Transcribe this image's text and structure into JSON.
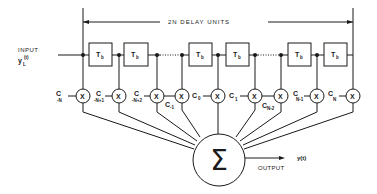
{
  "diagram": {
    "bracket_label": "2N   DELAY   UNITS",
    "input": {
      "label": "INPUT",
      "signal": "y",
      "signal_sub": "L",
      "signal_arg": "(t)"
    },
    "output": {
      "label": "OUTPUT",
      "signal": "y(t)"
    },
    "delay_label": "T",
    "delay_sub": "b",
    "multiplier_symbol": "X",
    "summer_symbol": "Σ",
    "coefficients": [
      {
        "c": "C",
        "sub": "-N"
      },
      {
        "c": "C",
        "sub": "-N+1"
      },
      {
        "c": "C",
        "sub": "-N+2"
      },
      {
        "c": "C",
        "sub": "-1"
      },
      {
        "c": "C",
        "sub": "0"
      },
      {
        "c": "C",
        "sub": "1"
      },
      {
        "c": "C",
        "sub": "N-2"
      },
      {
        "c": "C",
        "sub": "N-1"
      },
      {
        "c": "C",
        "sub": "N"
      }
    ],
    "delay_units": [
      {
        "label": "T",
        "sub": "b"
      },
      {
        "label": "T",
        "sub": "b"
      },
      {
        "label": "T",
        "sub": "b"
      },
      {
        "label": "T",
        "sub": "b"
      },
      {
        "label": "T",
        "sub": "b"
      },
      {
        "label": "T",
        "sub": "b"
      }
    ]
  }
}
